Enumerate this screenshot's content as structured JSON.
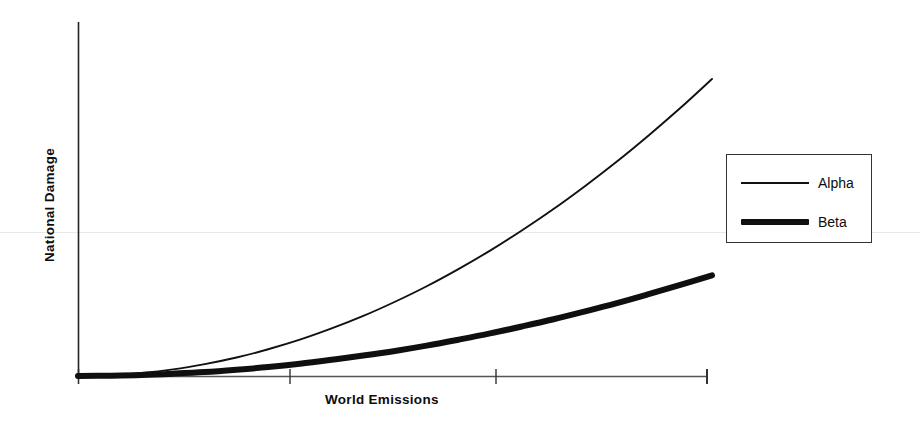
{
  "chart_data": {
    "type": "line",
    "title": "",
    "subtitle": "",
    "xlabel": "World Emissions",
    "ylabel": "National Damage",
    "grid": false,
    "legend_position": "right",
    "xlim": [
      0,
      100
    ],
    "ylim": [
      0,
      100
    ],
    "x_tick_labels": [
      "",
      "",
      "",
      ""
    ],
    "y_tick_labels": [],
    "x_ticks": [
      0,
      33.4,
      66.0,
      100
    ],
    "x": [
      0,
      5,
      10,
      15,
      20,
      25,
      30,
      35,
      40,
      45,
      50,
      55,
      60,
      65,
      70,
      75,
      80,
      85,
      90,
      95,
      100
    ],
    "series": [
      {
        "name": "Alpha",
        "style": "thin",
        "values": [
          0,
          0.2,
          0.9,
          2.0,
          3.6,
          5.6,
          8.1,
          11.0,
          14.4,
          18.2,
          22.5,
          27.2,
          32.4,
          38.0,
          44.1,
          50.6,
          57.6,
          65.0,
          72.9,
          81.2,
          90.0
        ]
      },
      {
        "name": "Beta",
        "style": "thick",
        "values": [
          0,
          0.1,
          0.3,
          0.7,
          1.2,
          1.9,
          2.7,
          3.7,
          4.9,
          6.2,
          7.6,
          9.2,
          11.0,
          12.9,
          15.0,
          17.2,
          19.6,
          22.1,
          24.8,
          27.6,
          30.5
        ]
      }
    ],
    "annotations": []
  },
  "axes": {
    "y_label": "National Damage",
    "x_label": "World Emissions"
  },
  "legend": {
    "entries": [
      {
        "label": "Alpha",
        "style": "thin"
      },
      {
        "label": "Beta",
        "style": "thick"
      }
    ]
  }
}
